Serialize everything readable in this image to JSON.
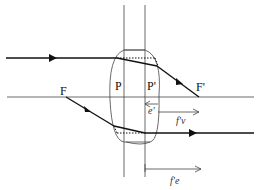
{
  "diagram": {
    "type": "thick-lens-ray-diagram",
    "labels": {
      "object_focal_point": "F",
      "image_focal_point": "F'",
      "object_principal_plane": "P",
      "image_principal_plane": "P'",
      "vertex_distance": "e'",
      "back_focal_length": "f'v",
      "effective_focal_length": "f'e"
    },
    "colors": {
      "line": "#222222",
      "background": "#ffffff"
    }
  }
}
